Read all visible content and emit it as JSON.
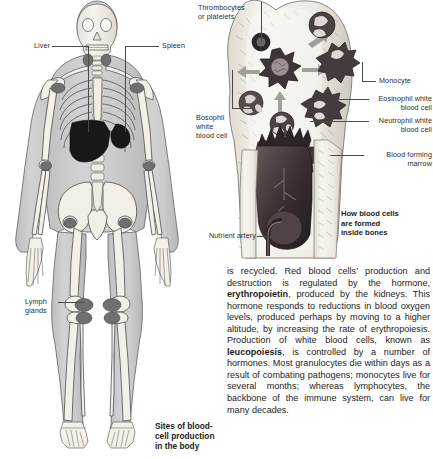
{
  "figure_left": {
    "caption": "Sites of blood-\ncell production\nin the body",
    "labels": [
      {
        "name": "liver",
        "text": "Liver"
      },
      {
        "name": "spleen",
        "text": "Spleen"
      },
      {
        "name": "lymph-glands",
        "text": "Lymph\nglands"
      }
    ]
  },
  "figure_right": {
    "caption": "How blood cells\nare formed\ninside bones",
    "labels": [
      {
        "name": "thrombocytes",
        "text": "Thrombocytes\nor platelets"
      },
      {
        "name": "basophil",
        "text": "Bosophil\nwhite\nblood cell"
      },
      {
        "name": "monocyte",
        "text": "Monocyte"
      },
      {
        "name": "eosinophil",
        "text": "Eosinophil white\nblood cell"
      },
      {
        "name": "neutrophil",
        "text": "Neutrophil white\nblood cell"
      },
      {
        "name": "blood-forming-marrow",
        "text": "Blood forming\nmarrow"
      },
      {
        "name": "nutrient-artery",
        "text": "Nutrient artery"
      }
    ]
  },
  "body_text": {
    "part1": "is recycled. Red blood cells’ production and destruction is regulated by the hormone, ",
    "bold1": "erythropoietin",
    "part2": ", produced by the kidneys. This hormone responds to reductions in blood oxygen levels, produced perhaps by moving to a higher altitude, by increasing the rate of erythropoiesis. Production of white blood cells, known as ",
    "bold2": "leucopoiesis",
    "part3": ", is controlled by a number of hormones. Most granulocytes die within days as a result of combating pathogens; monocytes live for several months; whereas lymphocytes, the backbone of the immune system, can live for many decades."
  },
  "colors": {
    "ink": "#231f20",
    "bone_light": "#f2efe9",
    "body_fill": "#c9c9c9",
    "organ_dark": "#1a1a1a",
    "marrow_dark": "#3a3133"
  }
}
